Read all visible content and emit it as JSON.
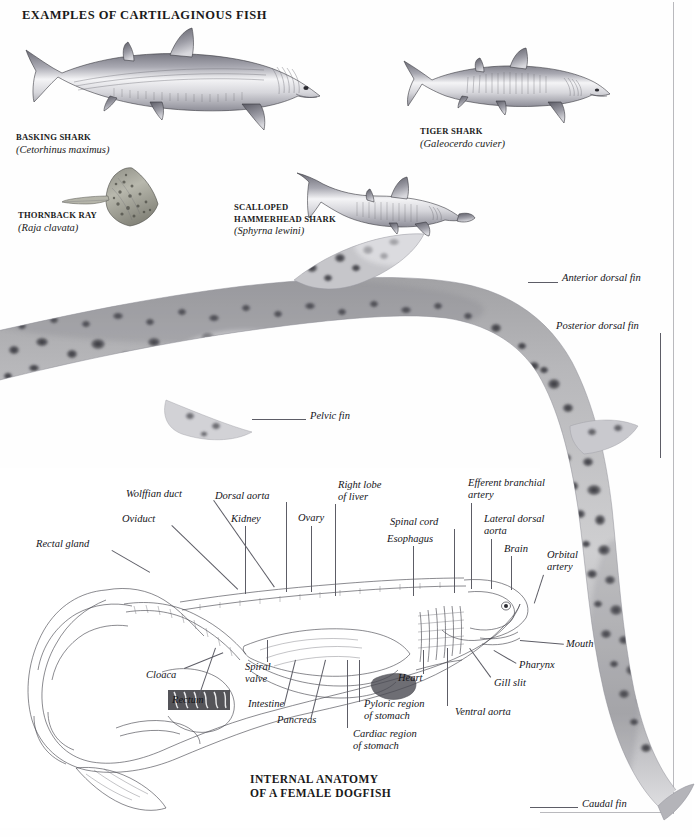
{
  "page": {
    "heading": "EXAMPLES OF CARTILAGINOUS FISH",
    "section_title": "INTERNAL ANATOMY\nOF A FEMALE DOGFISH"
  },
  "specimens": [
    {
      "common_name": "BASKING SHARK",
      "scientific_name": "(Cetorhinus maximus)"
    },
    {
      "common_name": "TIGER SHARK",
      "scientific_name": "(Galeocerdo cuvier)"
    },
    {
      "common_name": "THORNBACK RAY",
      "scientific_name": "(Raja clavata)"
    },
    {
      "common_name": "SCALLOPED\nHAMMERHEAD SHARK",
      "scientific_name": "(Sphyrna lewini)"
    }
  ],
  "external_labels": [
    {
      "text": "Anterior dorsal fin"
    },
    {
      "text": "Posterior dorsal fin"
    },
    {
      "text": "Pelvic fin"
    },
    {
      "text": "Caudal fin"
    }
  ],
  "anatomy_labels": [
    {
      "text": "Wolffian duct"
    },
    {
      "text": "Oviduct"
    },
    {
      "text": "Rectal gland"
    },
    {
      "text": "Dorsal aorta"
    },
    {
      "text": "Kidney"
    },
    {
      "text": "Ovary"
    },
    {
      "text": "Right lobe\nof liver"
    },
    {
      "text": "Spinal cord"
    },
    {
      "text": "Esophagus"
    },
    {
      "text": "Efferent branchial\nartery"
    },
    {
      "text": "Lateral dorsal\naorta"
    },
    {
      "text": "Brain"
    },
    {
      "text": "Orbital\nartery"
    },
    {
      "text": "Mouth"
    },
    {
      "text": "Pharynx"
    },
    {
      "text": "Gill slit"
    },
    {
      "text": "Ventral aorta"
    },
    {
      "text": "Heart"
    },
    {
      "text": "Pyloric region\nof stomach"
    },
    {
      "text": "Cardiac region\nof stomach"
    },
    {
      "text": "Pancreas"
    },
    {
      "text": "Intestine"
    },
    {
      "text": "Spiral\nvalve"
    },
    {
      "text": "Rectum"
    },
    {
      "text": "Cloaca"
    }
  ],
  "colors": {
    "ink": "#1a1a1a",
    "leader": "#5d5d66",
    "rule": "#b9b9bd",
    "fish_light": "#f2f2f2",
    "fish_mid": "#9a9aa2",
    "fish_dark": "#55555e",
    "skin_spot": "#3a3a3f"
  }
}
